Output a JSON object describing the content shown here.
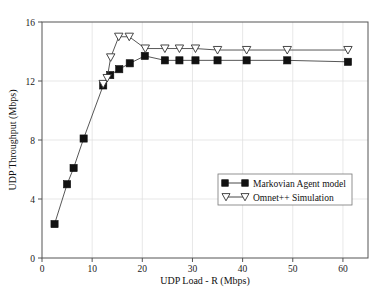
{
  "chart_data": {
    "type": "line",
    "title": "",
    "xlabel": "UDP Load - R (Mbps)",
    "ylabel": "UDP Throughput (Mbps)",
    "xlim": [
      0,
      65
    ],
    "ylim": [
      0,
      16
    ],
    "xticks": [
      0,
      10,
      20,
      30,
      40,
      50,
      60
    ],
    "xtick_labels": [
      "0",
      "10",
      "20",
      "30",
      "40",
      "50",
      "60"
    ],
    "yticks": [
      0,
      4,
      8,
      12,
      16
    ],
    "ytick_labels": [
      "0",
      "4",
      "8",
      "12",
      "16"
    ],
    "grid": true,
    "legend_position": "center-right",
    "series": [
      {
        "name": "Markovian Agent model",
        "marker": "filled-square",
        "color": "#111111",
        "points": [
          [
            2.5,
            2.3
          ],
          [
            5.0,
            5.0
          ],
          [
            6.3,
            6.1
          ],
          [
            8.3,
            8.1
          ],
          [
            12.2,
            11.7
          ],
          [
            13.6,
            12.4
          ],
          [
            15.4,
            12.8
          ],
          [
            17.5,
            13.2
          ],
          [
            20.5,
            13.7
          ],
          [
            24.5,
            13.4
          ],
          [
            27.4,
            13.4
          ],
          [
            30.6,
            13.4
          ],
          [
            35.0,
            13.4
          ],
          [
            40.8,
            13.4
          ],
          [
            48.9,
            13.4
          ],
          [
            61.0,
            13.3
          ]
        ]
      },
      {
        "name": "Omnet++ Simulation",
        "marker": "open-triangle",
        "color": "#ffffff",
        "points": [
          [
            12.2,
            11.8
          ],
          [
            13.0,
            12.2
          ],
          [
            13.7,
            13.6
          ],
          [
            15.3,
            15.0
          ],
          [
            17.4,
            15.0
          ],
          [
            20.6,
            14.2
          ],
          [
            24.5,
            14.2
          ],
          [
            27.4,
            14.2
          ],
          [
            30.6,
            14.2
          ],
          [
            35.0,
            14.1
          ],
          [
            40.8,
            14.1
          ],
          [
            48.9,
            14.1
          ],
          [
            61.0,
            14.1
          ]
        ]
      }
    ],
    "legend_entries": [
      {
        "label": "Markovian Agent model",
        "marker": "filled-square"
      },
      {
        "label": "Omnet++ Simulation",
        "marker": "open-triangle"
      }
    ]
  }
}
